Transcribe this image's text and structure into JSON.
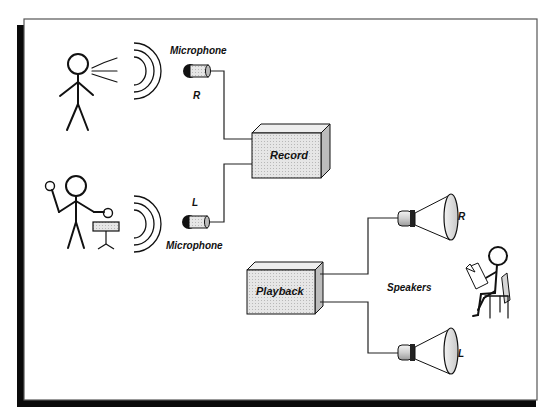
{
  "diagram": {
    "type": "stereo recording and playback diagram",
    "colors": {
      "ink": "#111111",
      "frame_shadow": "#0a0a0a",
      "box_fill": "#dcdcdc",
      "background": "#ffffff"
    },
    "labels": {
      "mic_top": "Microphone",
      "mic_top_channel": "R",
      "mic_bottom": "Microphone",
      "mic_bottom_channel": "L",
      "record": "Record",
      "playback": "Playback",
      "speakers": "Speakers",
      "speaker_top_channel": "R",
      "speaker_bottom_channel": "L"
    },
    "nodes": [
      {
        "id": "singer",
        "kind": "stick-figure",
        "role": "sound source (voice)"
      },
      {
        "id": "musician",
        "kind": "stick-figure",
        "role": "sound source (percussion)"
      },
      {
        "id": "mic_r",
        "kind": "microphone",
        "channel": "R"
      },
      {
        "id": "mic_l",
        "kind": "microphone",
        "channel": "L"
      },
      {
        "id": "record",
        "kind": "box"
      },
      {
        "id": "playback",
        "kind": "box"
      },
      {
        "id": "spk_r",
        "kind": "speaker",
        "channel": "R"
      },
      {
        "id": "spk_l",
        "kind": "speaker",
        "channel": "L"
      },
      {
        "id": "listener",
        "kind": "stick-figure",
        "role": "listener reading, seated"
      }
    ],
    "edges": [
      {
        "from": "mic_r",
        "to": "record"
      },
      {
        "from": "mic_l",
        "to": "record"
      },
      {
        "from": "playback",
        "to": "spk_r"
      },
      {
        "from": "playback",
        "to": "spk_l"
      }
    ]
  }
}
